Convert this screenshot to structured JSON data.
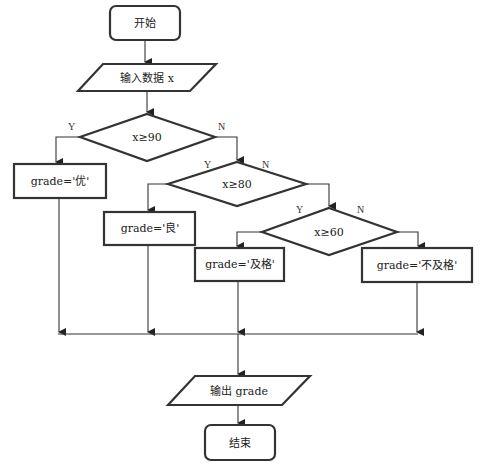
{
  "flowchart": {
    "start": {
      "label": "开始"
    },
    "input": {
      "label": "输入数据 x"
    },
    "decisions": [
      {
        "label": "x≥90",
        "yes": "Y",
        "no": "N"
      },
      {
        "label": "x≥80",
        "yes": "Y",
        "no": "N"
      },
      {
        "label": "x≥60",
        "yes": "Y",
        "no": "N"
      }
    ],
    "processes": [
      {
        "label": "grade='优'"
      },
      {
        "label": "grade='良'"
      },
      {
        "label": "grade='及格'"
      },
      {
        "label": "grade='不及格'"
      }
    ],
    "output": {
      "label": "输出 grade"
    },
    "end": {
      "label": "结束"
    }
  }
}
